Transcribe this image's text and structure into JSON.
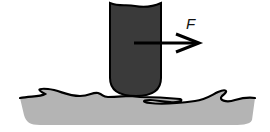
{
  "diagram": {
    "force_label": "F",
    "colors": {
      "probe": "#3a3a3a",
      "surface": "#b4b4b4",
      "outline": "#000000",
      "background": "#ffffff"
    }
  }
}
